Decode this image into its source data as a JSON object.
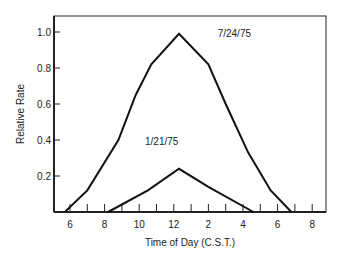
{
  "chart_data": {
    "type": "line",
    "title": "",
    "xlabel": "Time of Day (C.S.T.)",
    "ylabel": "Relative Rate",
    "xlim": [
      5.2,
      21.0
    ],
    "ylim": [
      0,
      1.1
    ],
    "x_unit": "hour of day (24h)",
    "x_ticks": [
      6,
      7,
      8,
      9,
      10,
      11,
      12,
      13,
      14,
      15,
      16,
      17,
      18,
      19,
      20
    ],
    "x_tick_labels": [
      {
        "x": 6,
        "label": "6"
      },
      {
        "x": 8,
        "label": "8"
      },
      {
        "x": 10,
        "label": "10"
      },
      {
        "x": 12,
        "label": "12"
      },
      {
        "x": 14,
        "label": "2"
      },
      {
        "x": 16,
        "label": "4"
      },
      {
        "x": 18,
        "label": "6"
      },
      {
        "x": 20,
        "label": "8"
      }
    ],
    "y_ticks": [
      0.2,
      0.4,
      0.6,
      0.8,
      1.0
    ],
    "y_tick_labels": [
      "0.2",
      "0.4",
      "0.6",
      "0.8",
      "1.0"
    ],
    "grid": false,
    "legend": "none (direct labels)",
    "series": [
      {
        "name": "7/24/75",
        "x": [
          5.7,
          7.0,
          8.8,
          9.8,
          10.7,
          12.3,
          14.0,
          15.0,
          16.3,
          17.6,
          18.8
        ],
        "y": [
          0.0,
          0.12,
          0.4,
          0.65,
          0.82,
          0.99,
          0.82,
          0.6,
          0.33,
          0.12,
          0.0
        ],
        "label_pos": {
          "x": 15.5,
          "y": 0.97
        }
      },
      {
        "name": "1/21/75",
        "x": [
          8.2,
          10.5,
          12.3,
          14.0,
          16.6
        ],
        "y": [
          0.0,
          0.12,
          0.24,
          0.14,
          0.0
        ],
        "label_pos": {
          "x": 11.3,
          "y": 0.37
        }
      }
    ],
    "annotations": [
      "7/24/75",
      "1/21/75"
    ]
  }
}
